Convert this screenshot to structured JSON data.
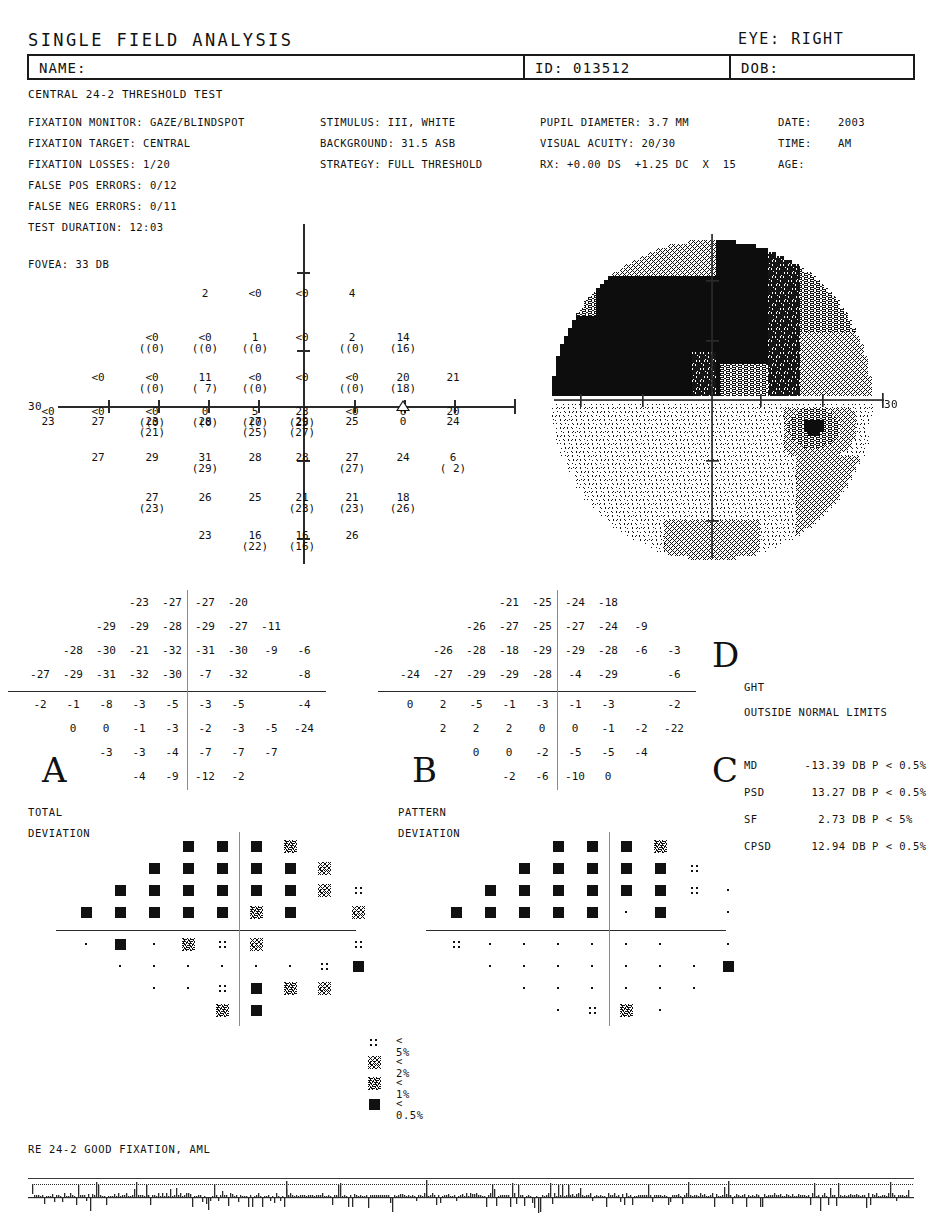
{
  "header": {
    "title": "SINGLE FIELD ANALYSIS",
    "eye_label": "EYE: RIGHT",
    "name_label": "NAME:",
    "id_label": "ID: 013512",
    "dob_label": "DOB:",
    "subtitle": "CENTRAL 24-2 THRESHOLD TEST"
  },
  "params": {
    "left": [
      "FIXATION MONITOR: GAZE/BLINDSPOT",
      "FIXATION TARGET: CENTRAL",
      "FIXATION LOSSES: 1/20",
      "FALSE POS ERRORS: 0/12",
      "FALSE NEG ERRORS: 0/11",
      "TEST DURATION: 12:03"
    ],
    "middle": [
      "STIMULUS: III, WHITE",
      "BACKGROUND: 31.5 ASB",
      "STRATEGY: FULL THRESHOLD"
    ],
    "right": [
      "PUPIL DIAMETER: 3.7 MM",
      "VISUAL ACUITY: 20/30",
      "RX: +0.00 DS  +1.25 DC  X  15"
    ],
    "meta_labels": [
      "DATE:",
      "TIME:",
      "AGE:"
    ],
    "meta_values": [
      "2003",
      "AM",
      ""
    ],
    "fovea": "FOVEA: 33 DB"
  },
  "threshold": {
    "axis_label_left": "30",
    "axis_label_right": "30",
    "blind_spot_marker": "triangle",
    "points": [
      {
        "col": 3,
        "row": 0,
        "v": "2"
      },
      {
        "col": 4,
        "row": 0,
        "v": "<0"
      },
      {
        "col": 5,
        "row": 0,
        "v": "<0"
      },
      {
        "col": 6,
        "row": 0,
        "v": "4"
      },
      {
        "col": 2,
        "row": 1,
        "v": "<0",
        "p": "((0)"
      },
      {
        "col": 3,
        "row": 1,
        "v": "<0",
        "p": "((0)"
      },
      {
        "col": 4,
        "row": 1,
        "v": "1",
        "p": "((0)"
      },
      {
        "col": 5,
        "row": 1,
        "v": "<0"
      },
      {
        "col": 6,
        "row": 1,
        "v": "2",
        "p": "((0)"
      },
      {
        "col": 7,
        "row": 1,
        "v": "14",
        "p": "(16)"
      },
      {
        "col": 1,
        "row": 2,
        "v": "<0"
      },
      {
        "col": 2,
        "row": 2,
        "v": "<0",
        "p": "((0)"
      },
      {
        "col": 3,
        "row": 2,
        "v": "11",
        "p": "( 7)"
      },
      {
        "col": 4,
        "row": 2,
        "v": "<0",
        "p": "((0)"
      },
      {
        "col": 5,
        "row": 2,
        "v": "<0"
      },
      {
        "col": 6,
        "row": 2,
        "v": "<0",
        "p": "((0)"
      },
      {
        "col": 7,
        "row": 2,
        "v": "20",
        "p": "(18)"
      },
      {
        "col": 8,
        "row": 2,
        "v": "21"
      },
      {
        "col": 0,
        "row": 3,
        "v": "<0"
      },
      {
        "col": 1,
        "row": 3,
        "v": "<0"
      },
      {
        "col": 2,
        "row": 3,
        "v": "<0",
        "p": "((0)"
      },
      {
        "col": 3,
        "row": 3,
        "v": "0",
        "p": "((0)"
      },
      {
        "col": 4,
        "row": 3,
        "v": "5",
        "p": "((0)"
      },
      {
        "col": 5,
        "row": 3,
        "v": "23",
        "p": "(25)"
      },
      {
        "col": 6,
        "row": 3,
        "v": "<0"
      },
      {
        "col": 7,
        "row": 3,
        "v": "6"
      },
      {
        "col": 8,
        "row": 3,
        "v": "20"
      },
      {
        "col": 0,
        "row": 4,
        "v": "23"
      },
      {
        "col": 1,
        "row": 4,
        "v": "27"
      },
      {
        "col": 2,
        "row": 4,
        "v": "23",
        "p": "(21)"
      },
      {
        "col": 3,
        "row": 4,
        "v": "28"
      },
      {
        "col": 4,
        "row": 4,
        "v": "27",
        "p": "(25)"
      },
      {
        "col": 5,
        "row": 4,
        "v": "29",
        "p": "(27)"
      },
      {
        "col": 6,
        "row": 4,
        "v": "25"
      },
      {
        "col": 7,
        "row": 4,
        "v": "0"
      },
      {
        "col": 8,
        "row": 4,
        "v": "24"
      },
      {
        "col": 1,
        "row": 5,
        "v": "27"
      },
      {
        "col": 2,
        "row": 5,
        "v": "29"
      },
      {
        "col": 3,
        "row": 5,
        "v": "31",
        "p": "(29)"
      },
      {
        "col": 4,
        "row": 5,
        "v": "28"
      },
      {
        "col": 5,
        "row": 5,
        "v": "28"
      },
      {
        "col": 6,
        "row": 5,
        "v": "27",
        "p": "(27)"
      },
      {
        "col": 7,
        "row": 5,
        "v": "24"
      },
      {
        "col": 8,
        "row": 5,
        "v": "6",
        "p": "( 2)"
      },
      {
        "col": 2,
        "row": 6,
        "v": "27",
        "p": "(23)"
      },
      {
        "col": 3,
        "row": 6,
        "v": "26"
      },
      {
        "col": 4,
        "row": 6,
        "v": "25"
      },
      {
        "col": 5,
        "row": 6,
        "v": "21",
        "p": "(23)"
      },
      {
        "col": 6,
        "row": 6,
        "v": "21",
        "p": "(23)"
      },
      {
        "col": 7,
        "row": 6,
        "v": "18",
        "p": "(26)"
      },
      {
        "col": 3,
        "row": 7,
        "v": "23"
      },
      {
        "col": 4,
        "row": 7,
        "v": "16",
        "p": "(22)"
      },
      {
        "col": 5,
        "row": 7,
        "v": "16",
        "p": "(16)"
      },
      {
        "col": 6,
        "row": 7,
        "v": "26"
      }
    ]
  },
  "total_deviation": {
    "letter": "A",
    "caption_line1": "TOTAL",
    "caption_line2": "DEVIATION",
    "rows": [
      {
        "start": 3,
        "values": [
          "-23",
          "-27",
          "-27",
          "-20"
        ]
      },
      {
        "start": 2,
        "values": [
          "-29",
          "-29",
          "-28",
          "-29",
          "-27",
          "-11"
        ]
      },
      {
        "start": 1,
        "values": [
          "-28",
          "-30",
          "-21",
          "-32",
          "-31",
          "-30",
          "-9",
          "-6"
        ]
      },
      {
        "start": 0,
        "values": [
          "-27",
          "-29",
          "-31",
          "-32",
          "-30",
          "-7",
          "-32",
          "",
          "-8"
        ]
      },
      {
        "start": 0,
        "values": [
          "-2",
          "-1",
          "-8",
          "-3",
          "-5",
          "-3",
          "-5",
          "",
          "-4"
        ]
      },
      {
        "start": 1,
        "values": [
          "0",
          "0",
          "-1",
          "-3",
          "-2",
          "-3",
          "-5",
          "-24"
        ]
      },
      {
        "start": 2,
        "values": [
          "-3",
          "-3",
          "-4",
          "-7",
          "-7",
          "-7"
        ]
      },
      {
        "start": 3,
        "values": [
          "-4",
          "-9",
          "-12",
          "-2"
        ]
      }
    ]
  },
  "pattern_deviation": {
    "letter": "B",
    "caption_line1": "PATTERN",
    "caption_line2": "DEVIATION",
    "rows": [
      {
        "start": 3,
        "values": [
          "-21",
          "-25",
          "-24",
          "-18"
        ]
      },
      {
        "start": 2,
        "values": [
          "-26",
          "-27",
          "-25",
          "-27",
          "-24",
          "-9"
        ]
      },
      {
        "start": 1,
        "values": [
          "-26",
          "-28",
          "-18",
          "-29",
          "-29",
          "-28",
          "-6",
          "-3"
        ]
      },
      {
        "start": 0,
        "values": [
          "-24",
          "-27",
          "-29",
          "-29",
          "-28",
          "-4",
          "-29",
          "",
          "-6"
        ]
      },
      {
        "start": 0,
        "values": [
          "0",
          "2",
          "-5",
          "-1",
          "-3",
          "-1",
          "-3",
          "",
          "-2"
        ]
      },
      {
        "start": 1,
        "values": [
          "2",
          "2",
          "2",
          "0",
          "0",
          "-1",
          "-2",
          "-22"
        ]
      },
      {
        "start": 2,
        "values": [
          "0",
          "0",
          "-2",
          "-5",
          "-5",
          "-4"
        ]
      },
      {
        "start": 3,
        "values": [
          "-2",
          "-6",
          "-10",
          "0"
        ]
      }
    ]
  },
  "global_indices": {
    "letter_c": "C",
    "letter_d": "D",
    "ght_label": "GHT",
    "ght_value": "OUTSIDE NORMAL LIMITS",
    "rows": [
      {
        "name": "MD",
        "value": "-13.39 DB",
        "p": "P < 0.5%"
      },
      {
        "name": "PSD",
        "value": "13.27 DB",
        "p": "P < 0.5%"
      },
      {
        "name": "SF",
        "value": "2.73 DB",
        "p": "P < 5%"
      },
      {
        "name": "CPSD",
        "value": "12.94 DB",
        "p": "P < 0.5%"
      }
    ]
  },
  "legend": {
    "items": [
      {
        "sym": "p5",
        "label": "< 5%"
      },
      {
        "sym": "p2",
        "label": "< 2%"
      },
      {
        "sym": "p1",
        "label": "< 1%"
      },
      {
        "sym": "p05",
        "label": "< 0.5%"
      }
    ]
  },
  "td_plot": {
    "rows": [
      {
        "start": 3,
        "syms": [
          "p05",
          "p05",
          "p05",
          "p1"
        ]
      },
      {
        "start": 2,
        "syms": [
          "p05",
          "p05",
          "p05",
          "p05",
          "p05",
          "p2"
        ]
      },
      {
        "start": 1,
        "syms": [
          "p05",
          "p05",
          "p05",
          "p05",
          "p05",
          "p05",
          "p2",
          "p5"
        ]
      },
      {
        "start": 0,
        "syms": [
          "p05",
          "p05",
          "p05",
          "p05",
          "p05",
          "p1",
          "p05",
          "",
          "p2"
        ]
      },
      {
        "start": 0,
        "syms": [
          "dot",
          "p05",
          "dot",
          "p1",
          "p5",
          "p2",
          "",
          "",
          "p5"
        ]
      },
      {
        "start": 1,
        "syms": [
          "dot",
          "dot",
          "dot",
          "dot",
          "dot",
          "dot",
          "p5",
          "p05"
        ]
      },
      {
        "start": 2,
        "syms": [
          "dot",
          "dot",
          "p5",
          "p05",
          "p1",
          "p2"
        ]
      },
      {
        "start": 3,
        "syms": [
          "",
          "p1",
          "p05",
          ""
        ]
      }
    ]
  },
  "pd_plot": {
    "rows": [
      {
        "start": 3,
        "syms": [
          "p05",
          "p05",
          "p05",
          "p1"
        ]
      },
      {
        "start": 2,
        "syms": [
          "p05",
          "p05",
          "p05",
          "p05",
          "p05",
          "p5"
        ]
      },
      {
        "start": 1,
        "syms": [
          "p05",
          "p05",
          "p05",
          "p05",
          "p05",
          "p05",
          "p5",
          "dot"
        ]
      },
      {
        "start": 0,
        "syms": [
          "p05",
          "p05",
          "p05",
          "p05",
          "p05",
          "dot",
          "p05",
          "",
          "dot"
        ]
      },
      {
        "start": 0,
        "syms": [
          "p5",
          "dot",
          "dot",
          "dot",
          "dot",
          "dot",
          "dot",
          "",
          "dot"
        ]
      },
      {
        "start": 1,
        "syms": [
          "dot",
          "dot",
          "dot",
          "dot",
          "dot",
          "dot",
          "dot",
          "p05"
        ]
      },
      {
        "start": 2,
        "syms": [
          "dot",
          "dot",
          "dot",
          "dot",
          "dot",
          "dot"
        ]
      },
      {
        "start": 3,
        "syms": [
          "dot",
          "p5",
          "p1",
          "dot"
        ]
      }
    ]
  },
  "footer": {
    "comment": "RE 24-2 GOOD FIXATION, AML"
  }
}
